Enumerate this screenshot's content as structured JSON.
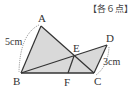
{
  "header": {
    "points_label": "【各６点】"
  },
  "diagram": {
    "points": {
      "A": {
        "label": "A",
        "x": 41,
        "y": 26
      },
      "B": {
        "label": "B",
        "x": 21,
        "y": 73
      },
      "C": {
        "label": "C",
        "x": 94,
        "y": 73
      },
      "D": {
        "label": "D",
        "x": 107,
        "y": 45
      },
      "E": {
        "label": "E",
        "x": 74,
        "y": 56
      },
      "F": {
        "label": "F",
        "x": 68,
        "y": 73
      }
    },
    "measurements": {
      "AB": "5cm",
      "CD": "3cm"
    },
    "colors": {
      "fill": "#d9d9d9",
      "stroke": "#333333"
    }
  }
}
